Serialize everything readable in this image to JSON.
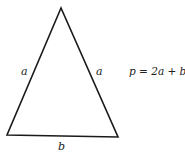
{
  "diagram": {
    "shape": "isosceles triangle",
    "vertices": {
      "apex": [
        61,
        8
      ],
      "bottom_left": [
        7,
        135
      ],
      "bottom_right": [
        118,
        137
      ]
    },
    "stroke_color": "#1a1a1a",
    "labels": {
      "left_side": "a",
      "right_side": "a",
      "base": "b"
    },
    "formula": "p = 2a + b"
  }
}
